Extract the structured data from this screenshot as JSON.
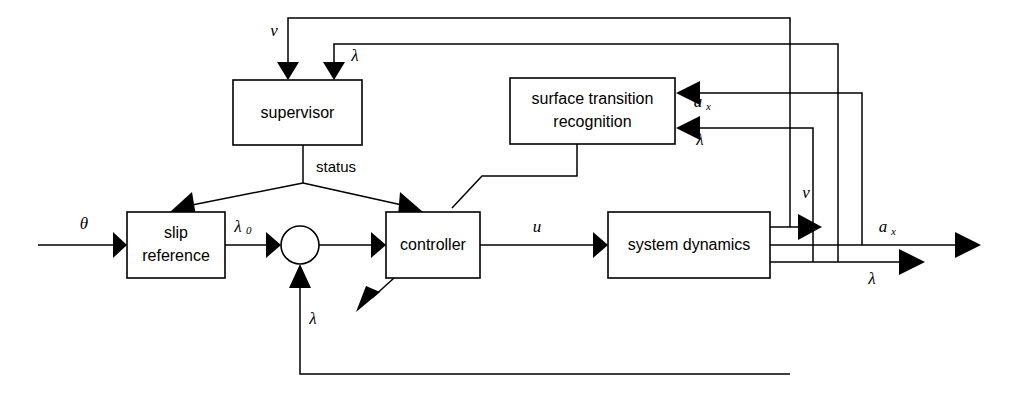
{
  "diagram": {
    "background": "#ffffff",
    "line_color": "#000000",
    "blocks": [
      {
        "id": "supervisor",
        "label": "supervisor",
        "label2": "",
        "x": 233,
        "y": 80,
        "w": 129,
        "h": 65
      },
      {
        "id": "surface",
        "label": "surface transition",
        "label2": "recognition",
        "x": 510,
        "y": 78,
        "w": 165,
        "h": 66
      },
      {
        "id": "slip",
        "label": "slip",
        "label2": "reference",
        "x": 127,
        "y": 212,
        "w": 98,
        "h": 66
      },
      {
        "id": "controller",
        "label": "controller",
        "label2": "",
        "x": 386,
        "y": 212,
        "w": 94,
        "h": 66
      },
      {
        "id": "sysdyn",
        "label": "system dynamics",
        "label2": "",
        "x": 608,
        "y": 212,
        "w": 162,
        "h": 66
      }
    ],
    "sum_node": {
      "id": "summing-junction",
      "cx": 300,
      "cy": 245,
      "r": 19
    },
    "signals": [
      {
        "id": "theta-input",
        "text": "θ",
        "sub": "",
        "x": 84,
        "y": 225
      },
      {
        "id": "v-to-supervisor",
        "text": "v",
        "sub": "",
        "x": 274,
        "y": 32
      },
      {
        "id": "lambda-to-supervisor",
        "text": "λ",
        "sub": "",
        "x": 355,
        "y": 56
      },
      {
        "id": "status-label",
        "text": "status",
        "sub": "",
        "x": 330,
        "y": 168,
        "plain": true
      },
      {
        "id": "lambda0",
        "text": "λ",
        "sub": "0",
        "x": 240,
        "y": 229
      },
      {
        "id": "u-signal",
        "text": "u",
        "sub": "",
        "x": 537,
        "y": 228
      },
      {
        "id": "lambda-feedback",
        "text": "λ",
        "sub": "",
        "x": 313,
        "y": 320
      },
      {
        "id": "ax-to-surface",
        "text": "a",
        "sub": "x",
        "x": 700,
        "y": 103
      },
      {
        "id": "lambda-to-surface",
        "text": "λ",
        "sub": "",
        "x": 700,
        "y": 140
      },
      {
        "id": "v-output",
        "text": "v",
        "sub": "",
        "x": 805,
        "y": 195
      },
      {
        "id": "ax-output",
        "text": "a",
        "sub": "x",
        "x": 885,
        "y": 228
      },
      {
        "id": "lambda-output",
        "text": "λ",
        "sub": "",
        "x": 872,
        "y": 279
      }
    ],
    "wire_paths": {
      "theta_in": "M 38 245 L 128 245",
      "slip_to_sum": "M 225 245 L 281 245",
      "sum_to_controller": "M 319 245 L 386 245",
      "controller_to_sysdyn": "M 480 245 L 608 245",
      "sysdyn_v_out": "M 770 227 L 790 227 L 790 18 L 288 18 L 288 70",
      "sysdyn_ax_out": "M 770 245 L 980 245",
      "sysdyn_lambda_out": "M 770 262 L 925 262",
      "v_arrow_branch": "M 790 227 L 812 227",
      "lambda_loop_up": "M 838 262 L 838 44 L 334 44 L 334 70",
      "ax_to_surface": "M 862 245 L 862 93 L 686 93",
      "lambda_to_surface": "M 813 262 L 813 128 L 686 128",
      "status_stem": "M 303 145 L 303 183",
      "status_left": "M 303 183 L 186 206",
      "status_right": "M 303 183 L 408 206",
      "surface_to_controller": "M 577 144 L 577 176 L 480 176 L 455 205",
      "controller_down_arrow": "M 392 278 L 368 300",
      "lambda_bottom_fb": "M 790 374 L 300 374 L 300 277"
    }
  }
}
